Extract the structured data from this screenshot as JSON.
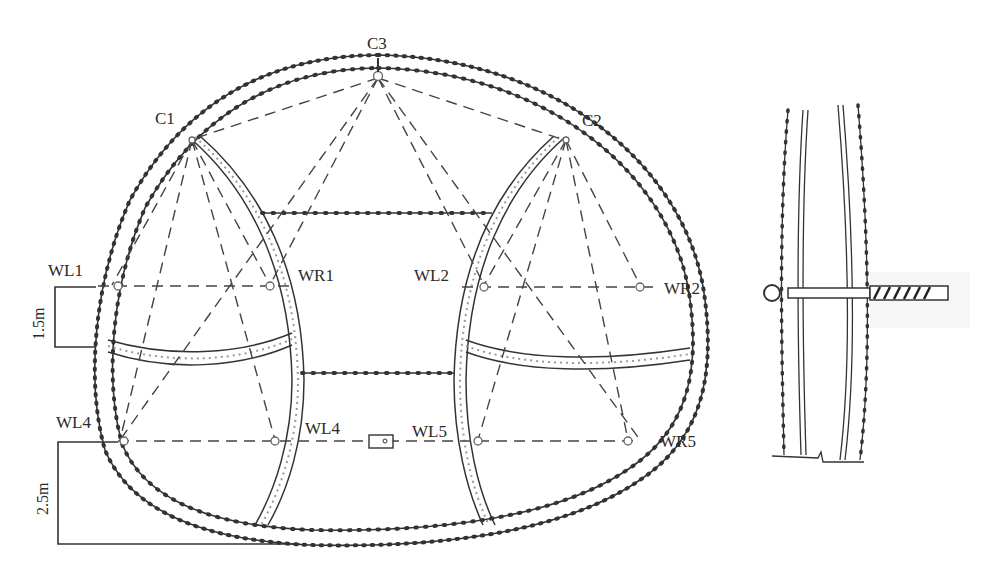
{
  "figure": {
    "type": "tunnel cross-section monitoring layout",
    "crown_points": [
      {
        "id": "C1",
        "label": "C1"
      },
      {
        "id": "C2",
        "label": "C2"
      },
      {
        "id": "C3",
        "label": "C3"
      }
    ],
    "upper_convergence_line": [
      {
        "id": "WL1",
        "label": "WL1"
      },
      {
        "id": "WR1",
        "label": "WR1"
      },
      {
        "id": "WL2",
        "label": "WL2"
      },
      {
        "id": "WR2",
        "label": "WR2"
      }
    ],
    "lower_convergence_line": [
      {
        "id": "WL4a",
        "label": "WL4"
      },
      {
        "id": "WL4b",
        "label": "WL4"
      },
      {
        "id": "WL5",
        "label": "WL5"
      },
      {
        "id": "WR5",
        "label": "WR5"
      }
    ],
    "dimensions": {
      "upper_offset": "1.5m",
      "lower_offset": "2.5m"
    },
    "detail": {
      "description": "Convergence anchor bolt through layered lining",
      "parts": [
        "eye-hook",
        "bolt-shaft",
        "threaded-anchor"
      ]
    },
    "colors": {
      "line": "#333333",
      "lining_fill": "#f4f4f4",
      "dash": "#444444"
    }
  }
}
